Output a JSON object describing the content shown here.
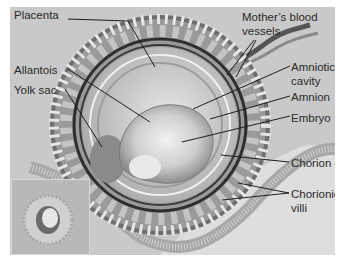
{
  "diagram": {
    "labels": {
      "placenta": "Placenta",
      "mothers_blood_vessels": "Mother’s blood\nvessels",
      "allantois": "Allantois",
      "yolk_sac": "Yolk sac",
      "amniotic_cavity": "Amniotic\ncavity",
      "amnion": "Amnion",
      "embryo": "Embryo",
      "chorion": "Chorion",
      "chorionic_villi": "Chorionic\nvilli"
    },
    "colors": {
      "background": "#c9c9c9",
      "light_region": "#dedede",
      "ring_dark": "#3a3a3a",
      "label_text": "#2a2a2a"
    }
  }
}
